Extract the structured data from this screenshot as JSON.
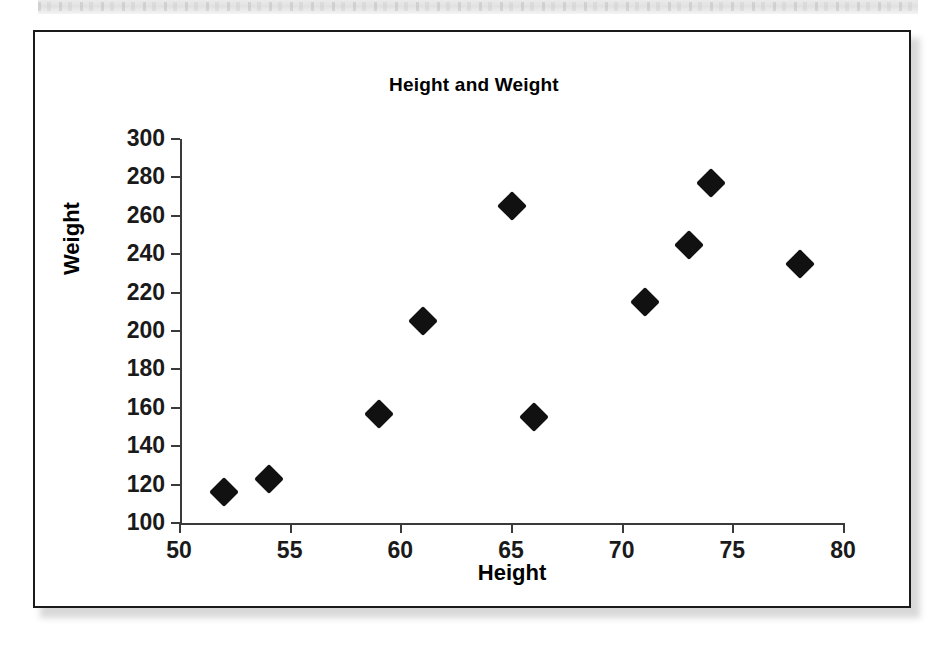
{
  "chart_data": {
    "type": "scatter",
    "title": "Height and Weight",
    "xlabel": "Height",
    "ylabel": "Weight",
    "xlim": [
      50,
      80
    ],
    "ylim": [
      100,
      300
    ],
    "xticks": [
      50,
      55,
      60,
      65,
      70,
      75,
      80
    ],
    "yticks": [
      100,
      120,
      140,
      160,
      180,
      200,
      220,
      240,
      260,
      280,
      300
    ],
    "grid": false,
    "legend": null,
    "marker": "diamond",
    "marker_color": "#111111",
    "series": [
      {
        "name": "Height and Weight",
        "x": [
          52,
          54,
          59,
          61,
          65,
          66,
          71,
          73,
          74,
          78
        ],
        "y": [
          116,
          123,
          157,
          205,
          265,
          155,
          215,
          245,
          277,
          235
        ],
        "points": [
          {
            "x": 52,
            "y": 116
          },
          {
            "x": 54,
            "y": 123
          },
          {
            "x": 59,
            "y": 157
          },
          {
            "x": 61,
            "y": 205
          },
          {
            "x": 65,
            "y": 265
          },
          {
            "x": 66,
            "y": 155
          },
          {
            "x": 71,
            "y": 215
          },
          {
            "x": 73,
            "y": 245
          },
          {
            "x": 74,
            "y": 277
          },
          {
            "x": 78,
            "y": 235
          }
        ]
      }
    ]
  },
  "figure": {
    "border_color": "#1a1a1a",
    "background": "#ffffff",
    "axis_color": "#3a3a3a"
  }
}
